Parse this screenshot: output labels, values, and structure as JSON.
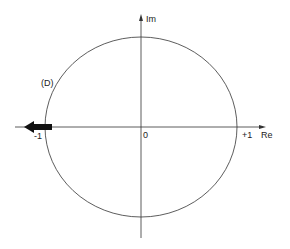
{
  "diagram": {
    "type": "complex-plane",
    "axes": {
      "real_label": "Re",
      "imag_label": "Im"
    },
    "labels": {
      "origin": "0",
      "plus_one": "+1",
      "minus_one": "-1",
      "curve": "(D)"
    },
    "curve": {
      "shape": "circle",
      "center": [
        0,
        0
      ],
      "radius": 1
    },
    "arrow": {
      "position": "-1",
      "direction": "left"
    },
    "colors": {
      "stroke": "#222222",
      "background": "#ffffff"
    }
  }
}
